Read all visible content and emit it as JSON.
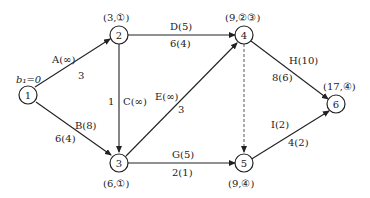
{
  "diagram": {
    "type": "network-flow",
    "start_label": "b₁=0",
    "nodes": [
      {
        "id": "1",
        "label": "1",
        "annotation": ""
      },
      {
        "id": "2",
        "label": "2",
        "annotation": "(3,①)"
      },
      {
        "id": "3",
        "label": "3",
        "annotation": "(6,①)"
      },
      {
        "id": "4",
        "label": "4",
        "annotation": "(9,②③)"
      },
      {
        "id": "5",
        "label": "5",
        "annotation": "(9,④)"
      },
      {
        "id": "6",
        "label": "6",
        "annotation": "(17,④)"
      }
    ],
    "edges": [
      {
        "from": "1",
        "to": "2",
        "name": "A(∞)",
        "value": "3"
      },
      {
        "from": "1",
        "to": "3",
        "name": "B(8)",
        "value": "6(4)"
      },
      {
        "from": "2",
        "to": "3",
        "name": "C(∞)",
        "value": "1"
      },
      {
        "from": "2",
        "to": "4",
        "name": "D(5)",
        "value": "6(4)"
      },
      {
        "from": "3",
        "to": "4",
        "name": "E(∞)",
        "value": "3"
      },
      {
        "from": "3",
        "to": "5",
        "name": "G(5)",
        "value": "2(1)"
      },
      {
        "from": "4",
        "to": "6",
        "name": "H(10)",
        "value": "8(6)"
      },
      {
        "from": "5",
        "to": "6",
        "name": "I(2)",
        "value": "4(2)"
      },
      {
        "from": "4",
        "to": "5",
        "name": "",
        "value": "",
        "style": "dashed"
      }
    ]
  }
}
